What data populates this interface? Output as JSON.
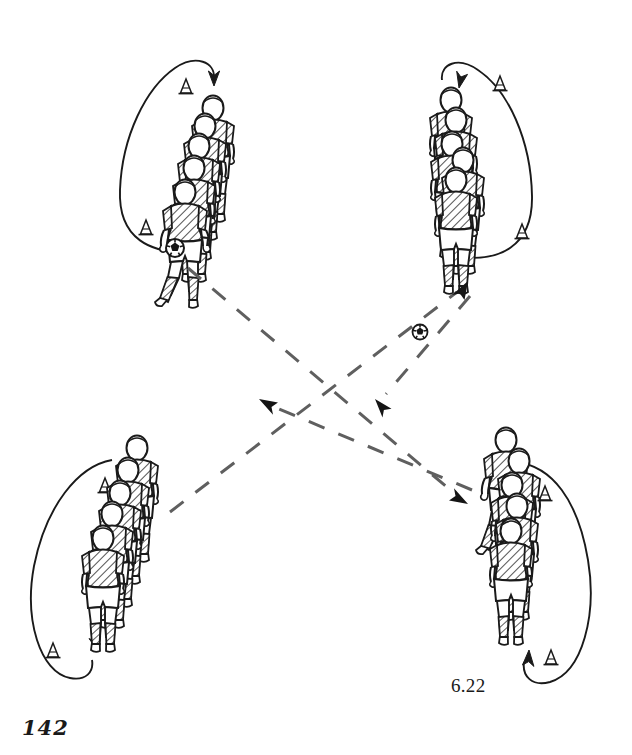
{
  "figure": {
    "number": "6.22",
    "page_number": "142",
    "type": "soccer-training-drill-diagram",
    "style": {
      "background": "#ffffff",
      "ink": "#1a1a1a",
      "dashed_path": "#5f5f5f",
      "ball_fill": "#151515"
    },
    "groups": [
      {
        "id": "top-left",
        "label": "player-queue-top-left",
        "position": {
          "x": 196,
          "y": 165
        },
        "player_count": 5,
        "has_ball": true,
        "ball": {
          "x": 175,
          "y": 248
        },
        "loop": {
          "direction": "counter-clockwise",
          "arrow_tip": {
            "x": 209,
            "y": 80
          },
          "arrow_angle": 105
        },
        "cones": [
          {
            "x": 186,
            "y": 88
          },
          {
            "x": 146,
            "y": 229
          }
        ]
      },
      {
        "id": "top-right",
        "label": "player-queue-top-right",
        "position": {
          "x": 452,
          "y": 170
        },
        "player_count": 5,
        "has_ball": false,
        "loop": {
          "direction": "clockwise",
          "arrow_tip": {
            "x": 463,
            "y": 82
          },
          "arrow_angle": 75
        },
        "cones": [
          {
            "x": 500,
            "y": 85
          },
          {
            "x": 522,
            "y": 233
          }
        ]
      },
      {
        "id": "bottom-left",
        "label": "player-queue-bottom-left",
        "position": {
          "x": 110,
          "y": 530
        },
        "player_count": 5,
        "has_ball": false,
        "loop": {
          "direction": "clockwise",
          "arrow_tip": {
            "x": 99,
            "y": 652
          },
          "arrow_angle": -55
        },
        "cones": [
          {
            "x": 105,
            "y": 487
          },
          {
            "x": 53,
            "y": 652
          }
        ]
      },
      {
        "id": "bottom-right",
        "label": "player-queue-bottom-right",
        "position": {
          "x": 512,
          "y": 525
        },
        "player_count": 5,
        "has_ball": false,
        "loop": {
          "direction": "counter-clockwise",
          "arrow_tip": {
            "x": 529,
            "y": 650
          },
          "arrow_angle": -115
        },
        "cones": [
          {
            "x": 545,
            "y": 495
          },
          {
            "x": 551,
            "y": 659
          }
        ]
      }
    ],
    "passes": [
      {
        "id": "pass-tl-to-br",
        "from": "top-left",
        "to": "bottom-right",
        "start": {
          "x": 188,
          "y": 268
        },
        "end": {
          "x": 466,
          "y": 504
        },
        "arrow": true
      },
      {
        "id": "pass-bl-to-tr",
        "from": "bottom-left",
        "to": "top-right",
        "start": {
          "x": 170,
          "y": 512
        },
        "end": {
          "x": 468,
          "y": 281
        },
        "arrow": true,
        "ball_in_flight": {
          "x": 420,
          "y": 332
        }
      },
      {
        "id": "pass-br-to-tl",
        "from": "bottom-right",
        "to": "top-left",
        "start": {
          "x": 472,
          "y": 490
        },
        "end": {
          "x": 259,
          "y": 399
        },
        "arrow": true
      },
      {
        "id": "pass-tr-to-bl",
        "from": "top-right",
        "to": "bottom-left",
        "start": {
          "x": 470,
          "y": 296
        },
        "end": {
          "x": 375,
          "y": 399
        },
        "arrow": true
      }
    ]
  }
}
